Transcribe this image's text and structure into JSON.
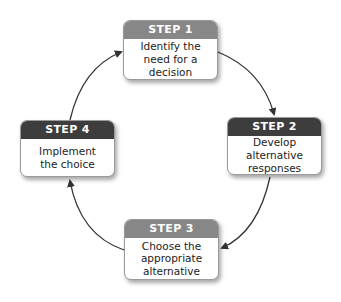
{
  "diagram": {
    "type": "cycle",
    "steps": [
      {
        "label": "STEP 1",
        "text": "Identify the need for a decision",
        "header_color": "#878787"
      },
      {
        "label": "STEP 2",
        "text": "Develop alternative responses",
        "header_color": "#3d3d3d"
      },
      {
        "label": "STEP 3",
        "text": "Choose the appropriate alternative",
        "header_color": "#878787"
      },
      {
        "label": "STEP 4",
        "text": "Implement the choice",
        "header_color": "#3d3d3d"
      }
    ],
    "arrows": [
      {
        "from": "STEP 1",
        "to": "STEP 2"
      },
      {
        "from": "STEP 2",
        "to": "STEP 3"
      },
      {
        "from": "STEP 3",
        "to": "STEP 4"
      },
      {
        "from": "STEP 4",
        "to": "STEP 1"
      }
    ],
    "colors": {
      "header_light": "#878787",
      "header_dark": "#3d3d3d",
      "arrow": "#333333"
    }
  }
}
